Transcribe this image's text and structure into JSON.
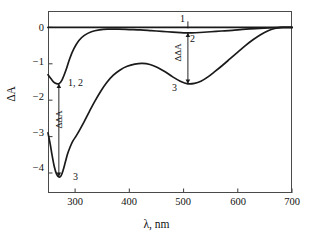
{
  "figure": {
    "background": "#ffffff",
    "frame_color": "#4a4a4a",
    "curve_color": "#1a1a1a"
  },
  "axes": {
    "xlabel": "λ, nm",
    "ylabel": "ΔA",
    "x_ticks": [
      "300",
      "400",
      "500",
      "600",
      "700"
    ],
    "y_ticks": [
      "0",
      "−1",
      "−2",
      "−3",
      "−4"
    ]
  },
  "annotations": {
    "label_1": "1",
    "label_2": "2",
    "label_3_right": "3",
    "label_12_left": "1, 2",
    "label_3_left": "3",
    "ddA_left": "ΔΔA",
    "ddA_right": "ΔΔA"
  },
  "chart_data": {
    "type": "line",
    "title": "",
    "xlabel": "λ, nm",
    "ylabel": "ΔA",
    "xlim": [
      250,
      700
    ],
    "ylim": [
      -4.55,
      0.45
    ],
    "xticks": [
      300,
      400,
      500,
      600,
      700
    ],
    "yticks": [
      0,
      -1,
      -2,
      -3,
      -4
    ],
    "grid": false,
    "legend": "none (curves labelled inline: 1, 2, 3)",
    "annotations": [
      {
        "text": "1",
        "x": 508,
        "y": 0.28,
        "note": "curve 1 label, above zero line"
      },
      {
        "text": "2",
        "x": 525,
        "y": -0.35,
        "note": "curve 2 label"
      },
      {
        "text": "3",
        "x": 480,
        "y": -1.82,
        "note": "curve 3 label near 510 nm minimum"
      },
      {
        "text": "1, 2",
        "x": 288,
        "y": -1.48,
        "note": "curves 1 and 2 label near 270 nm minimum"
      },
      {
        "text": "3",
        "x": 292,
        "y": -4.12,
        "note": "curve 3 label at deep 270 nm minimum"
      },
      {
        "text": "ΔΔA",
        "x": 266,
        "y": -2.85,
        "note": "double-headed arrow between curve 1,2 minimum (-1.55) and curve 3 minimum (-4.10) at 270 nm"
      },
      {
        "text": "ΔΔA",
        "x": 503,
        "y": -0.88,
        "note": "double-headed arrow between curve 2 (-0.15) and curve 3 (-1.55) at 510 nm"
      }
    ],
    "series": [
      {
        "name": "1",
        "label": "1",
        "points": [
          [
            250,
            0.0
          ],
          [
            260,
            0.0
          ],
          [
            270,
            0.0
          ],
          [
            285,
            0.0
          ],
          [
            300,
            0.0
          ],
          [
            325,
            0.0
          ],
          [
            350,
            0.0
          ],
          [
            375,
            0.0
          ],
          [
            400,
            0.0
          ],
          [
            425,
            0.0
          ],
          [
            450,
            0.0
          ],
          [
            475,
            0.0
          ],
          [
            500,
            0.0
          ],
          [
            525,
            0.0
          ],
          [
            550,
            0.0
          ],
          [
            575,
            0.0
          ],
          [
            600,
            0.0
          ],
          [
            625,
            0.0
          ],
          [
            650,
            0.0
          ],
          [
            675,
            0.0
          ],
          [
            700,
            0.0
          ]
        ]
      },
      {
        "name": "2",
        "label": "2",
        "points": [
          [
            250,
            -1.3
          ],
          [
            256,
            -1.42
          ],
          [
            262,
            -1.52
          ],
          [
            270,
            -1.55
          ],
          [
            276,
            -1.44
          ],
          [
            283,
            -1.18
          ],
          [
            290,
            -0.86
          ],
          [
            298,
            -0.58
          ],
          [
            307,
            -0.36
          ],
          [
            317,
            -0.22
          ],
          [
            330,
            -0.12
          ],
          [
            345,
            -0.07
          ],
          [
            360,
            -0.05
          ],
          [
            380,
            -0.05
          ],
          [
            400,
            -0.06
          ],
          [
            420,
            -0.07
          ],
          [
            440,
            -0.09
          ],
          [
            460,
            -0.11
          ],
          [
            480,
            -0.13
          ],
          [
            500,
            -0.15
          ],
          [
            515,
            -0.15
          ],
          [
            530,
            -0.14
          ],
          [
            550,
            -0.12
          ],
          [
            570,
            -0.1
          ],
          [
            590,
            -0.08
          ],
          [
            615,
            -0.05
          ],
          [
            640,
            -0.03
          ],
          [
            665,
            -0.01
          ],
          [
            685,
            0.0
          ],
          [
            700,
            0.0
          ]
        ]
      },
      {
        "name": "3",
        "label": "3",
        "points": [
          [
            250,
            -2.9
          ],
          [
            254,
            -3.2
          ],
          [
            258,
            -3.55
          ],
          [
            262,
            -3.85
          ],
          [
            266,
            -4.04
          ],
          [
            270,
            -4.11
          ],
          [
            274,
            -4.08
          ],
          [
            278,
            -3.92
          ],
          [
            282,
            -3.7
          ],
          [
            286,
            -3.48
          ],
          [
            291,
            -3.28
          ],
          [
            296,
            -3.12
          ],
          [
            302,
            -2.98
          ],
          [
            309,
            -2.8
          ],
          [
            317,
            -2.58
          ],
          [
            326,
            -2.32
          ],
          [
            336,
            -2.04
          ],
          [
            347,
            -1.76
          ],
          [
            358,
            -1.52
          ],
          [
            370,
            -1.32
          ],
          [
            383,
            -1.17
          ],
          [
            396,
            -1.07
          ],
          [
            410,
            -1.01
          ],
          [
            424,
            -0.99
          ],
          [
            438,
            -1.02
          ],
          [
            452,
            -1.1
          ],
          [
            466,
            -1.22
          ],
          [
            480,
            -1.36
          ],
          [
            494,
            -1.48
          ],
          [
            508,
            -1.55
          ],
          [
            520,
            -1.54
          ],
          [
            532,
            -1.48
          ],
          [
            545,
            -1.36
          ],
          [
            558,
            -1.21
          ],
          [
            572,
            -1.04
          ],
          [
            586,
            -0.86
          ],
          [
            600,
            -0.68
          ],
          [
            614,
            -0.5
          ],
          [
            628,
            -0.34
          ],
          [
            642,
            -0.2
          ],
          [
            656,
            -0.09
          ],
          [
            668,
            -0.03
          ],
          [
            680,
            0.0
          ],
          [
            690,
            0.0
          ],
          [
            700,
            0.0
          ]
        ]
      }
    ]
  }
}
